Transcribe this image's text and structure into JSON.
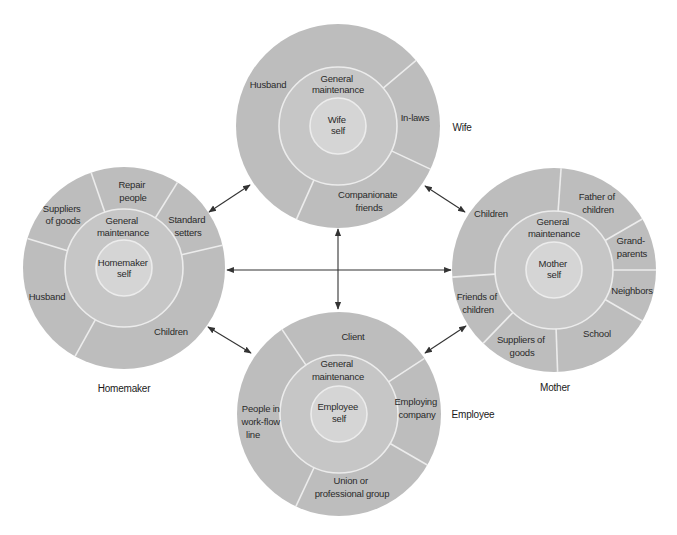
{
  "diagram": {
    "type": "role-set network",
    "colors": {
      "outer_ring": "#bdbdbd",
      "middle_ring": "#c6c6c6",
      "core": "#d5d5d5",
      "dividers": "#ececec",
      "arrows": "#333333"
    },
    "roles": {
      "wife": {
        "label": "Wife",
        "core": [
          "Wife",
          "self"
        ],
        "ring": [
          "General",
          "maintenance"
        ],
        "segments": [
          {
            "label": [
              "Husband"
            ]
          },
          {
            "label": [
              "In-laws"
            ]
          },
          {
            "label": [
              "Companionate",
              "friends"
            ]
          }
        ]
      },
      "homemaker": {
        "label": "Homemaker",
        "core": [
          "Homemaker",
          "self"
        ],
        "ring": [
          "General",
          "maintenance"
        ],
        "segments": [
          {
            "label": [
              "Suppliers",
              "of goods"
            ]
          },
          {
            "label": [
              "Repair",
              "people"
            ]
          },
          {
            "label": [
              "Standard",
              "setters"
            ]
          },
          {
            "label": [
              "Children"
            ]
          },
          {
            "label": [
              "Husband"
            ]
          }
        ]
      },
      "mother": {
        "label": "Mother",
        "core": [
          "Mother",
          "self"
        ],
        "ring": [
          "General",
          "maintenance"
        ],
        "segments": [
          {
            "label": [
              "Children"
            ]
          },
          {
            "label": [
              "Father of",
              "children"
            ]
          },
          {
            "label": [
              "Grand-",
              "parents"
            ]
          },
          {
            "label": [
              "Neighbors"
            ]
          },
          {
            "label": [
              "School"
            ]
          },
          {
            "label": [
              "Suppliers of",
              "goods"
            ]
          },
          {
            "label": [
              "Friends of",
              "children"
            ]
          }
        ]
      },
      "employee": {
        "label": "Employee",
        "core": [
          "Employee",
          "self"
        ],
        "ring": [
          "General",
          "maintenance"
        ],
        "segments": [
          {
            "label": [
              "Client"
            ]
          },
          {
            "label": [
              "Employing",
              "company"
            ]
          },
          {
            "label": [
              "Union or",
              "professional group"
            ]
          },
          {
            "label": [
              "People in",
              "work-flow",
              "line"
            ]
          }
        ]
      }
    },
    "connections": [
      {
        "from": "homemaker",
        "to": "wife",
        "bidirectional": true
      },
      {
        "from": "wife",
        "to": "mother",
        "bidirectional": true
      },
      {
        "from": "homemaker",
        "to": "employee",
        "bidirectional": true
      },
      {
        "from": "employee",
        "to": "mother",
        "bidirectional": true
      },
      {
        "from": "homemaker",
        "to": "mother",
        "bidirectional": true
      },
      {
        "from": "wife",
        "to": "employee",
        "bidirectional": true
      }
    ]
  }
}
